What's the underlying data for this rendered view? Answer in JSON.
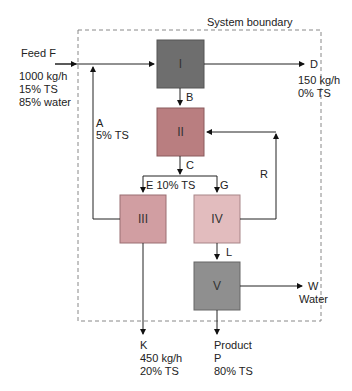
{
  "diagram": {
    "boundary_label": "System boundary",
    "units": [
      {
        "id": "I",
        "label": "I",
        "color": "#6e6e6e"
      },
      {
        "id": "II",
        "label": "II",
        "color": "#b97e80"
      },
      {
        "id": "III",
        "label": "III",
        "color": "#d19ea2"
      },
      {
        "id": "IV",
        "label": "IV",
        "color": "#e2bcbe"
      },
      {
        "id": "V",
        "label": "V",
        "color": "#8f8f8f"
      }
    ],
    "streams": {
      "feed": {
        "name": "Feed F",
        "line1": "1000 kg/h",
        "line2": "15% TS",
        "line3": "85% water"
      },
      "A": {
        "name": "A",
        "line1": "5% TS"
      },
      "B": {
        "name": "B"
      },
      "C": {
        "name": "C"
      },
      "D": {
        "name": "D",
        "line1": "150 kg/h",
        "line2": "0% TS"
      },
      "E": {
        "name": "E 10% TS"
      },
      "G": {
        "name": "G"
      },
      "R": {
        "name": "R"
      },
      "L": {
        "name": "L"
      },
      "W": {
        "name": "W",
        "line1": "Water"
      },
      "K": {
        "name": "K",
        "line1": "450 kg/h",
        "line2": "20% TS"
      },
      "P": {
        "name": "Product",
        "line1": "P",
        "line2": "80% TS"
      }
    }
  }
}
